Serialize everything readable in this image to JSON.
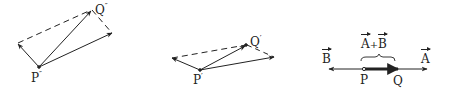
{
  "diagrams": [
    {
      "id": "parallelogram-1",
      "point_origin": {
        "label": "P",
        "prime": "″"
      },
      "point_sum": {
        "label": "Q",
        "prime": "″"
      }
    },
    {
      "id": "parallelogram-2",
      "point_origin": {
        "label": "P",
        "prime": "′"
      },
      "point_sum": {
        "label": "Q",
        "prime": "′"
      }
    },
    {
      "id": "collinear",
      "vector_b": "B",
      "vector_a": "A",
      "sum_label_a": "A",
      "sum_plus": "+",
      "sum_label_b": "B",
      "point_origin": "P",
      "point_sum": "Q"
    }
  ],
  "colors": {
    "ink": "#222222",
    "background": "#ffffff"
  }
}
